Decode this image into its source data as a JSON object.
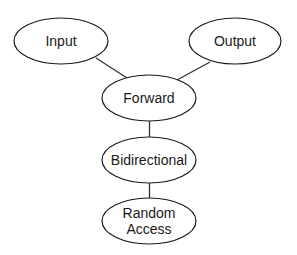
{
  "diagram": {
    "type": "iterator-hierarchy",
    "colors": {
      "background": "#ffffff",
      "stroke": "#1a1a1a",
      "text": "#1a1a1a"
    },
    "nodes": [
      {
        "id": "input",
        "label": "Input",
        "cx": 61,
        "cy": 41,
        "rx": 47,
        "ry": 23
      },
      {
        "id": "output",
        "label": "Output",
        "cx": 235,
        "cy": 41,
        "rx": 46,
        "ry": 23
      },
      {
        "id": "forward",
        "label": "Forward",
        "cx": 149,
        "cy": 98,
        "rx": 47,
        "ry": 23
      },
      {
        "id": "bidirectional",
        "label": "Bidirectional",
        "cx": 149,
        "cy": 160,
        "rx": 47,
        "ry": 23
      },
      {
        "id": "random_access",
        "label_line1": "Random",
        "label_line2": "Access",
        "cx": 149,
        "cy": 221,
        "rx": 47,
        "ry": 23
      }
    ],
    "edges": [
      {
        "from": "input",
        "to": "forward"
      },
      {
        "from": "output",
        "to": "forward"
      },
      {
        "from": "forward",
        "to": "bidirectional"
      },
      {
        "from": "bidirectional",
        "to": "random_access"
      }
    ]
  }
}
